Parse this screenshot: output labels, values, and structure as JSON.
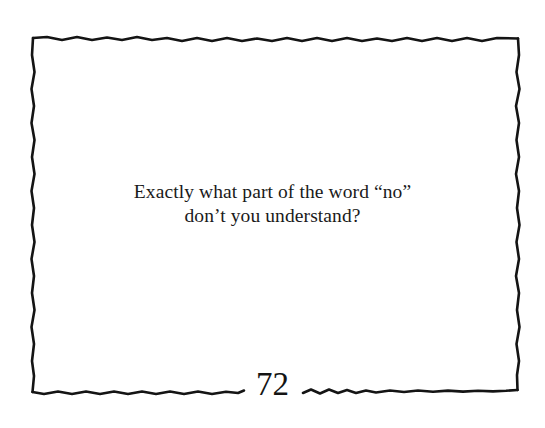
{
  "page": {
    "background_color": "#ffffff",
    "ink_color": "#141414",
    "text_color": "#1a1a1a"
  },
  "frame": {
    "style_name": "hand-drawn-wavy-rectangle",
    "stroke_color": "#141414",
    "stroke_width": 2.5,
    "bounds": {
      "left": 33,
      "top": 37,
      "right": 518,
      "bottom": 392
    },
    "bottom_gap_for_page_number": {
      "start_x": 244,
      "end_x": 303
    }
  },
  "quote": {
    "lines": [
      "Exactly what part of the word “no”",
      "don’t you understand?"
    ],
    "full_text": "Exactly what part of the word “no” don’t you understand?"
  },
  "footer": {
    "page_number": "72"
  }
}
